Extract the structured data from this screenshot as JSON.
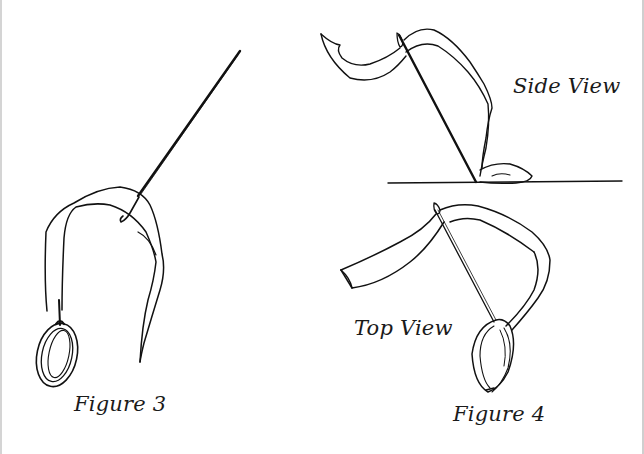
{
  "figure3": {
    "caption": "Figure 3",
    "elements": [
      "needle",
      "ribbon",
      "ring"
    ]
  },
  "figure4": {
    "caption": "Figure 4",
    "side_view": {
      "label": "Side View",
      "elements": [
        "needle",
        "ribbon",
        "surface-line"
      ]
    },
    "top_view": {
      "label": "Top View",
      "elements": [
        "needle",
        "ribbon",
        "ring"
      ]
    }
  },
  "colors": {
    "ink": "#111111",
    "background": "#ffffff",
    "frame": "#d0d0d0"
  }
}
